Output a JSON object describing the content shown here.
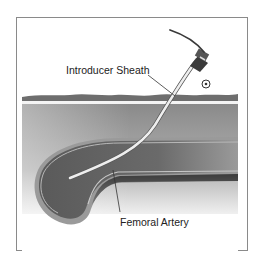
{
  "diagram": {
    "labels": {
      "introducer_sheath": "Introducer Sheath",
      "femoral_artery": "Femoral Artery"
    },
    "colors": {
      "frame_border": "#8a8a8a",
      "skin_top": "#6e6e6e",
      "tissue_top": "#8c8c8c",
      "tissue_bottom": "#e6e6e6",
      "artery_wall": "#a8a8a8",
      "artery_lumen": "#4a4a4a",
      "sheath": "#e8e8e8"
    }
  }
}
